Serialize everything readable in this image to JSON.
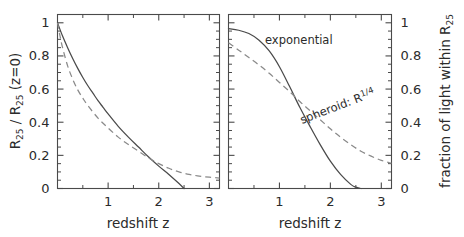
{
  "figure": {
    "title": "",
    "background_color": "#ffffff",
    "line_color": "#4a4a4a",
    "dash_color": "#8a8a8a"
  },
  "panels": {
    "left": {
      "name": "left-panel",
      "xlabel": "redshift  z",
      "ylabel_parts": {
        "r1": "R",
        "sub1": "25",
        "slash": " / ",
        "r2": "R",
        "sub2": "25",
        "tail": "  (z=0)"
      },
      "ylabel_plain": "R25 / R25 (z=0)",
      "xticklabels": [
        "1",
        "2",
        "3"
      ],
      "yticklabels": [
        "0",
        "0.2",
        "0.4",
        "0.6",
        "0.8",
        "1"
      ],
      "xlim": [
        0,
        3.2
      ],
      "ylim": [
        0,
        1.05
      ]
    },
    "right": {
      "name": "right-panel",
      "xlabel": "redshift  z",
      "ylabel_parts": {
        "head": "fraction of light within  R",
        "sub": "25"
      },
      "ylabel_plain": "fraction of light within R25",
      "xticklabels": [
        "1",
        "2",
        "3"
      ],
      "yticklabels": [
        "0",
        "0.2",
        "0.4",
        "0.6",
        "0.8",
        "1"
      ],
      "xlim": [
        0,
        3.2
      ],
      "ylim": [
        0,
        1.05
      ],
      "annotations": {
        "exponential": "exponential",
        "spheroid_head": "spheroid: R",
        "spheroid_exp": "1/4",
        "spheroid_plain": "spheroid: R1/4"
      }
    }
  },
  "chart_data": [
    {
      "type": "line",
      "id": "left-panel",
      "title": "",
      "xlabel": "redshift  z",
      "ylabel": "R25 / R25 (z=0)",
      "xlim": [
        0,
        3.2
      ],
      "ylim": [
        0,
        1.05
      ],
      "xticks": [
        0,
        0.5,
        1,
        1.5,
        2,
        2.5,
        3
      ],
      "xticklabels": [
        "",
        "",
        "1",
        "",
        "2",
        "",
        "3"
      ],
      "yticks": [
        0,
        0.2,
        0.4,
        0.6,
        0.8,
        1
      ],
      "yticklabels": [
        "0",
        "0.2",
        "0.4",
        "0.6",
        "0.8",
        "1"
      ],
      "grid": false,
      "legend": "none",
      "series": [
        {
          "name": "exponential",
          "style": "solid",
          "color": "#4a4a4a",
          "x": [
            0.0,
            0.1,
            0.2,
            0.3,
            0.4,
            0.5,
            0.6,
            0.7,
            0.8,
            0.9,
            1.0,
            1.2,
            1.4,
            1.6,
            1.8,
            2.0,
            2.2,
            2.4,
            2.5
          ],
          "y": [
            1.0,
            0.92,
            0.85,
            0.785,
            0.725,
            0.67,
            0.62,
            0.575,
            0.53,
            0.49,
            0.45,
            0.375,
            0.31,
            0.25,
            0.19,
            0.135,
            0.085,
            0.03,
            0.0
          ]
        },
        {
          "name": "spheroid: R1/4",
          "style": "dashed",
          "color": "#8a8a8a",
          "x": [
            0.0,
            0.05,
            0.1,
            0.2,
            0.3,
            0.4,
            0.5,
            0.6,
            0.8,
            1.0,
            1.2,
            1.4,
            1.6,
            1.8,
            2.0,
            2.2,
            2.4,
            2.6,
            2.8,
            3.0,
            3.2
          ],
          "y": [
            1.0,
            0.92,
            0.85,
            0.74,
            0.66,
            0.595,
            0.545,
            0.5,
            0.425,
            0.365,
            0.31,
            0.265,
            0.225,
            0.185,
            0.15,
            0.122,
            0.1,
            0.085,
            0.075,
            0.068,
            0.063
          ]
        }
      ]
    },
    {
      "type": "line",
      "id": "right-panel",
      "title": "",
      "xlabel": "redshift  z",
      "ylabel": "fraction of light within R25",
      "ylabel_side": "right",
      "xlim": [
        0,
        3.2
      ],
      "ylim": [
        0,
        1.05
      ],
      "xticks": [
        0,
        0.5,
        1,
        1.5,
        2,
        2.5,
        3
      ],
      "xticklabels": [
        "",
        "",
        "1",
        "",
        "2",
        "",
        "3"
      ],
      "yticks": [
        0,
        0.2,
        0.4,
        0.6,
        0.8,
        1
      ],
      "yticklabels": [
        "0",
        "0.2",
        "0.4",
        "0.6",
        "0.8",
        "1"
      ],
      "grid": false,
      "legend": "inline-annotations",
      "series": [
        {
          "name": "exponential",
          "style": "solid",
          "color": "#4a4a4a",
          "x": [
            0.0,
            0.2,
            0.4,
            0.6,
            0.8,
            1.0,
            1.2,
            1.4,
            1.6,
            1.8,
            2.0,
            2.2,
            2.4,
            2.5,
            2.6
          ],
          "y": [
            0.965,
            0.955,
            0.935,
            0.895,
            0.83,
            0.735,
            0.615,
            0.49,
            0.375,
            0.265,
            0.165,
            0.085,
            0.025,
            0.008,
            0.0
          ]
        },
        {
          "name": "spheroid: R1/4",
          "style": "dashed",
          "color": "#8a8a8a",
          "x": [
            0.0,
            0.2,
            0.4,
            0.6,
            0.8,
            1.0,
            1.2,
            1.4,
            1.6,
            1.8,
            2.0,
            2.2,
            2.4,
            2.6,
            2.8,
            3.0,
            3.2
          ],
          "y": [
            0.88,
            0.835,
            0.79,
            0.745,
            0.695,
            0.64,
            0.585,
            0.525,
            0.47,
            0.415,
            0.36,
            0.31,
            0.265,
            0.225,
            0.195,
            0.17,
            0.152
          ]
        }
      ],
      "annotations": [
        {
          "text": "exponential",
          "x": 0.55,
          "y": 0.93,
          "rotation": 0
        },
        {
          "text": "spheroid: R1/4",
          "x": 1.5,
          "y": 0.45,
          "rotation": -21
        }
      ]
    }
  ]
}
